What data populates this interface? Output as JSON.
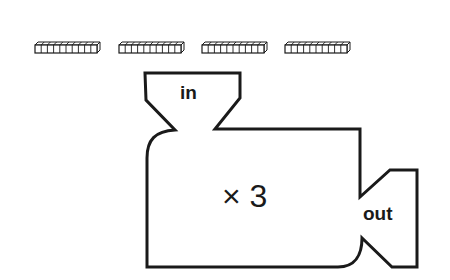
{
  "diagram": {
    "input_label": "in",
    "output_label": "out",
    "rule": "× 3",
    "input_items": {
      "type": "ten-rod",
      "count": 4,
      "units_per_rod": 10
    },
    "colors": {
      "stroke": "#1a1a1a",
      "background": "#ffffff"
    }
  }
}
